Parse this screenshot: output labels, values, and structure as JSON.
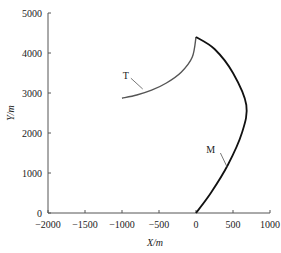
{
  "chart_data": {
    "type": "line",
    "title": "",
    "xlabel": "X/m",
    "ylabel": "Y/m",
    "xlim": [
      -2000,
      1000
    ],
    "ylim": [
      0,
      5000
    ],
    "x_ticks": [
      "-2000",
      "-1500",
      "-1000",
      "-500",
      "0",
      "500",
      "1000"
    ],
    "y_ticks": [
      "0",
      "1000",
      "2000",
      "3000",
      "4000",
      "5000"
    ],
    "grid": false,
    "series": [
      {
        "name": "T",
        "color": "#555555",
        "points": [
          [
            -1000,
            2870
          ],
          [
            -800,
            2950
          ],
          [
            -600,
            3070
          ],
          [
            -400,
            3250
          ],
          [
            -200,
            3520
          ],
          [
            -50,
            3900
          ],
          [
            0,
            4400
          ]
        ]
      },
      {
        "name": "M",
        "color": "#111111",
        "points": [
          [
            0,
            4400
          ],
          [
            250,
            4100
          ],
          [
            500,
            3500
          ],
          [
            680,
            2700
          ],
          [
            620,
            2000
          ],
          [
            430,
            1200
          ],
          [
            200,
            500
          ],
          [
            0,
            0
          ]
        ]
      }
    ],
    "annotations": [
      {
        "text": "T",
        "x": -950,
        "y": 3350
      },
      {
        "text": "M",
        "x": 200,
        "y": 1500
      }
    ]
  }
}
